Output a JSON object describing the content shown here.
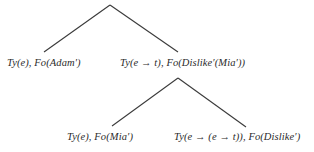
{
  "diagram": {
    "kind": "semantic-tree",
    "background_color": "#ffffff",
    "line_color": "#3a3a3a",
    "text_color": "#2b2b2b",
    "nodes": [
      {
        "id": "root-left-daughter",
        "label": "Ty(e), Fo(Adam′)",
        "type_label": "Ty(e)",
        "formula_label": "Fo(Adam′)"
      },
      {
        "id": "root-right-daughter",
        "label": "Ty(e → t), Fo(Dislike′(Mia′))",
        "type_label": "Ty(e → t)",
        "formula_label": "Fo(Dislike′(Mia′))"
      },
      {
        "id": "sub-left-daughter",
        "label": "Ty(e), Fo(Mia′)",
        "type_label": "Ty(e)",
        "formula_label": "Fo(Mia′)"
      },
      {
        "id": "sub-right-daughter",
        "label": "Ty(e → (e → t)), Fo(Dislike′)",
        "type_label": "Ty(e → (e → t))",
        "formula_label": "Fo(Dislike′)"
      }
    ],
    "branches": [
      {
        "id": "root-left-branch",
        "from": [
          110,
          5
        ],
        "to": [
          44,
          52
        ]
      },
      {
        "id": "root-right-branch",
        "from": [
          110,
          5
        ],
        "to": [
          178,
          52
        ]
      },
      {
        "id": "sub-left-branch",
        "from": [
          178,
          78
        ],
        "to": [
          112,
          126
        ]
      },
      {
        "id": "sub-right-branch",
        "from": [
          178,
          78
        ],
        "to": [
          246,
          127
        ]
      }
    ]
  }
}
